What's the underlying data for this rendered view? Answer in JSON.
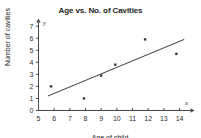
{
  "chart_data": {
    "type": "scatter",
    "title": "Age vs. No. of Cavities",
    "xlabel": "Age of child",
    "ylabel": "Number of cavities",
    "x_axis_letter": "x",
    "y_axis_letter": "y",
    "xlim": [
      5,
      14.7
    ],
    "ylim": [
      0,
      7.3
    ],
    "xticks": [
      5,
      6,
      7,
      8,
      9,
      10,
      11,
      12,
      13,
      14
    ],
    "yticks": [
      0,
      1,
      2,
      3,
      4,
      5,
      6,
      7
    ],
    "xtick_labels": [
      "5",
      "6",
      "7",
      "8",
      "9",
      "10",
      "11",
      "12",
      "13",
      "14"
    ],
    "ytick_labels": [
      "0",
      "1",
      "2",
      "3",
      "4",
      "5",
      "6",
      "7"
    ],
    "grid": false,
    "legend": "none",
    "points": [
      {
        "x": 5.8,
        "y": 2.0
      },
      {
        "x": 7.9,
        "y": 1.0
      },
      {
        "x": 9.0,
        "y": 2.9
      },
      {
        "x": 9.9,
        "y": 3.8
      },
      {
        "x": 11.8,
        "y": 5.9
      },
      {
        "x": 13.8,
        "y": 4.7
      }
    ],
    "trend_line": {
      "x1": 5.6,
      "y1": 1.2,
      "x2": 14.3,
      "y2": 5.9
    },
    "marker_color": "#3a3a3a",
    "line_color": "#3d3d3d",
    "axis_color": "#4a4a4a",
    "background_color": "#ffffff"
  }
}
